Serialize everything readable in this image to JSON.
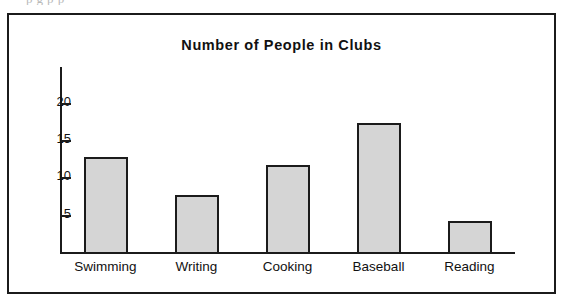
{
  "scan": {
    "top_artifact_text": "p        g  p                                                    p"
  },
  "chart_data": {
    "type": "bar",
    "title": "Number of People in Clubs",
    "xlabel": "",
    "ylabel": "",
    "categories": [
      "Swimming",
      "Writing",
      "Cooking",
      "Baseball",
      "Reading"
    ],
    "values": [
      12.8,
      7.6,
      11.7,
      17.3,
      4.2
    ],
    "ylim": [
      0,
      23
    ],
    "yticks": [
      5,
      10,
      15,
      20
    ],
    "ytick_labels": [
      "5",
      "10",
      "15",
      "20"
    ],
    "grid": false,
    "legend": null,
    "bar_fill_color": "#d5d5d5",
    "bar_edge_color": "#1b1b1b",
    "axis_color": "#1b1b1b",
    "background_color": "#ffffff",
    "frame_border_color": "#1b1b1b"
  }
}
